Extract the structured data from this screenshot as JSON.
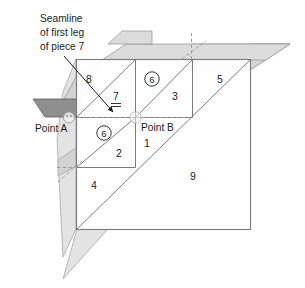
{
  "figure": {
    "callout": {
      "lines": [
        "Seamline",
        "of first leg",
        "of piece 7"
      ]
    },
    "points": [
      {
        "id": "point-a",
        "label": "Point A"
      },
      {
        "id": "point-b",
        "label": "Point B"
      }
    ],
    "pieces": [
      {
        "id": "piece-1",
        "label": "1",
        "circled": false
      },
      {
        "id": "piece-2",
        "label": "2",
        "circled": false
      },
      {
        "id": "piece-3",
        "label": "3",
        "circled": false
      },
      {
        "id": "piece-4",
        "label": "4",
        "circled": false
      },
      {
        "id": "piece-5",
        "label": "5",
        "circled": false
      },
      {
        "id": "piece-6-upper",
        "label": "6",
        "circled": true
      },
      {
        "id": "piece-6-lower",
        "label": "6",
        "circled": true
      },
      {
        "id": "piece-7",
        "label": "7",
        "circled": false,
        "double_underline": true
      },
      {
        "id": "piece-8",
        "label": "8",
        "circled": false
      },
      {
        "id": "piece-9",
        "label": "9",
        "circled": false
      }
    ],
    "colors": {
      "line": "#6e6e6e",
      "line_dark": "#555555",
      "ink": "#1b1b1b",
      "flap_light": "#dcdcdc",
      "flap_mid": "#c9c9c9",
      "flap_dark": "#8c8c8c",
      "background": "#ffffff",
      "dashed": "#9a9a9a"
    }
  }
}
